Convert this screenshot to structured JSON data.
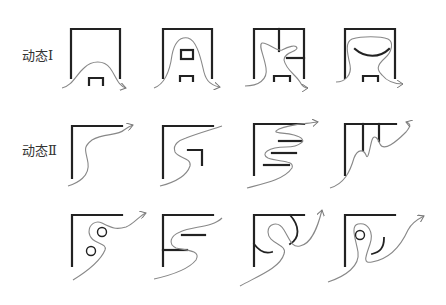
{
  "labels": {
    "row1": "动态Ⅰ",
    "row2": "动态Ⅱ"
  },
  "rows": [
    {
      "name": "动态Ⅰ",
      "panels": [
        "flow-under-arch",
        "flow-around-box",
        "flow-through-partition",
        "flow-around-curve"
      ]
    },
    {
      "name": "动态Ⅱ",
      "panels": [
        "corner-s-curve",
        "corner-hook",
        "corner-zigzag-bars",
        "corner-comb"
      ]
    },
    {
      "name": "",
      "panels": [
        "corner-circles",
        "corner-e-bars",
        "corner-arc-loop",
        "corner-circle-loop"
      ]
    }
  ],
  "colors": {
    "wall": "#222222",
    "flow": "#888888"
  }
}
